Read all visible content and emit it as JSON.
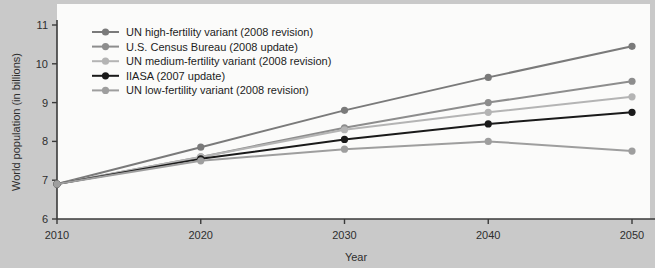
{
  "chart_data": {
    "type": "line",
    "title": "",
    "xlabel": "Year",
    "ylabel": "World population (in billions)",
    "x": [
      2010,
      2020,
      2030,
      2040,
      2050
    ],
    "xtick_labels": [
      "2010",
      "2020",
      "2030",
      "2040",
      "2050"
    ],
    "ytick_labels": [
      "6",
      "7",
      "8",
      "9",
      "10",
      "11"
    ],
    "ytick_values": [
      6,
      7,
      8,
      9,
      10,
      11
    ],
    "xlim": [
      2010,
      2050
    ],
    "ylim": [
      6,
      11
    ],
    "grid": false,
    "legend_position": "top-left",
    "series": [
      {
        "name": "UN high-fertility variant (2008 revision)",
        "color": "#7a7a7a",
        "values": [
          6.9,
          7.85,
          8.8,
          9.65,
          10.45
        ]
      },
      {
        "name": "U.S. Census Bureau (2008 update)",
        "color": "#8d8d8d",
        "values": [
          6.9,
          7.6,
          8.35,
          9.0,
          9.55
        ]
      },
      {
        "name": "UN medium-fertility variant (2008 revision)",
        "color": "#b4b4b4",
        "values": [
          6.9,
          7.6,
          8.3,
          8.75,
          9.15
        ]
      },
      {
        "name": "IIASA (2007 update)",
        "color": "#1a1a1a",
        "values": [
          6.9,
          7.55,
          8.05,
          8.45,
          8.75
        ]
      },
      {
        "name": "UN low-fertility variant (2008 revision)",
        "color": "#9e9e9e",
        "values": [
          6.9,
          7.5,
          7.8,
          8.0,
          7.75
        ]
      }
    ]
  },
  "colors": {
    "page_background": "#c9c9c9",
    "plot_background": "#fbfbfa",
    "axis": "#3a3a3a",
    "text": "#2e2e2e"
  }
}
